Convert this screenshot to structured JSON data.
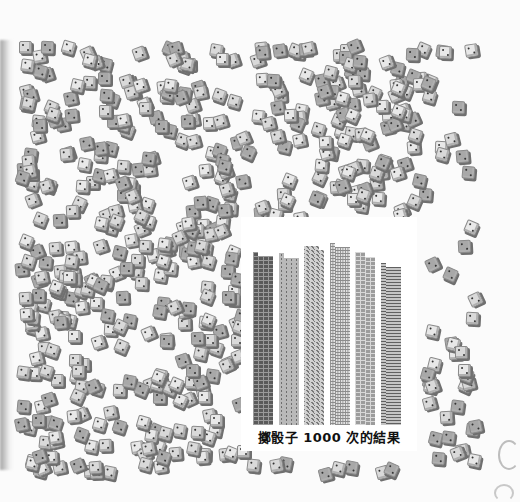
{
  "chart_data": {
    "type": "bar",
    "title": "擲骰子 1000 次的結果",
    "xlabel": "",
    "ylabel": "",
    "categories": [
      "1",
      "2",
      "3",
      "4",
      "5",
      "6"
    ],
    "values": [
      166,
      165,
      172,
      175,
      166,
      156
    ],
    "total": 1000,
    "grid": false,
    "legend": "none",
    "note": "Each bar is a stack of small dice-cell pictograms in 4 sub-columns; bars distinguished by grayscale texture.",
    "ylim": [
      0,
      200
    ],
    "bar_patterns": [
      "dark-grid",
      "dotted",
      "diagonal",
      "fine-grid",
      "medium-grid",
      "horizontal-lines"
    ],
    "subcolumn_offsets": [
      [
        0,
        4,
        4,
        4
      ],
      [
        0,
        5,
        5,
        5
      ],
      [
        0,
        0,
        0,
        4
      ],
      [
        0,
        4,
        4,
        4
      ],
      [
        0,
        0,
        5,
        5
      ],
      [
        0,
        4,
        4,
        4
      ]
    ]
  },
  "caption": "擲骰子 1000 次的結果",
  "background": {
    "description": "scattered dice",
    "dice_count": 700,
    "field": {
      "x0": 14,
      "y0": 40,
      "x1": 470,
      "y1": 468
    }
  }
}
